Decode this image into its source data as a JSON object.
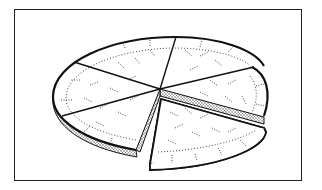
{
  "figure": {
    "slice_count": 6,
    "removed_slice_count": 1,
    "colors": {
      "ink": "#1a1a1a",
      "background": "#ffffff",
      "stipple": "#555555"
    }
  }
}
